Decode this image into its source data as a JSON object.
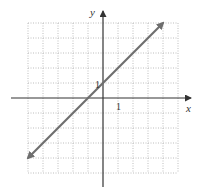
{
  "chart_data": {
    "type": "line",
    "title": "",
    "xlabel": "x",
    "ylabel": "y",
    "xlim": [
      -5,
      5
    ],
    "ylim": [
      -5,
      5
    ],
    "grid": true,
    "grid_style": "dotted",
    "tick_labels": {
      "x": [
        "1"
      ],
      "y": [
        "1"
      ]
    },
    "series": [
      {
        "name": "y = x + 1",
        "equation": "y = x + 1",
        "slope": 1,
        "y_intercept": 1,
        "x_intercept": -1,
        "x": [
          -5,
          4
        ],
        "y": [
          -4,
          5
        ],
        "arrows": "both",
        "color": "#6e6e6e"
      }
    ]
  },
  "labels": {
    "x_axis": "x",
    "y_axis": "y",
    "x_tick": "1",
    "y_tick": "1"
  },
  "colors": {
    "axis": "#333333",
    "grid": "#bdbdbd",
    "line": "#6e6e6e"
  }
}
